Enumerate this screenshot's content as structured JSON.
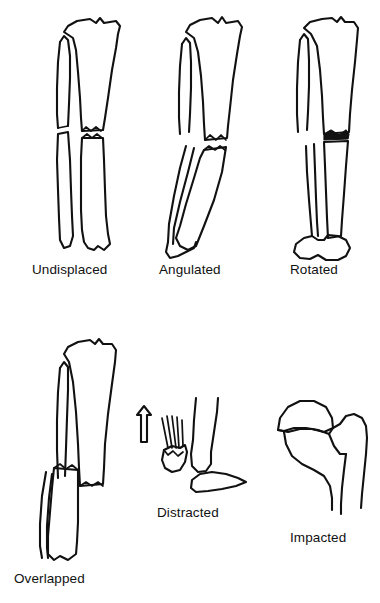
{
  "illustration": {
    "title": "Types of fracture displacement",
    "background_color": "#ffffff",
    "ink_color": "#111111",
    "style": "black-and-white hand-drawn line illustration"
  },
  "figures": [
    {
      "id": "undisplaced",
      "label": "Undisplaced",
      "bone": "tibia and fibula",
      "view": "anteroposterior",
      "description": "Transverse fracture through the tibial shaft with the fragments in anatomical alignment",
      "label_x": 32,
      "label_y": 262
    },
    {
      "id": "angulated",
      "label": "Angulated",
      "bone": "tibia and fibula",
      "view": "anteroposterior",
      "description": "Distal fragment tilted at an angle to the proximal fragment",
      "label_x": 159,
      "label_y": 262
    },
    {
      "id": "rotated",
      "label": "Rotated",
      "bone": "tibia and fibula",
      "view": "anteroposterior",
      "description": "Distal fragment twisted about the long axis so the ankle faces a different direction",
      "label_x": 290,
      "label_y": 262
    },
    {
      "id": "overlapped",
      "label": "Overlapped",
      "bone": "tibia and fibula",
      "view": "anteroposterior",
      "description": "Fragments displaced side by side and overriding, producing shortening",
      "label_x": 14,
      "label_y": 571
    },
    {
      "id": "distracted",
      "label": "Distracted",
      "bone": "patella at the knee joint",
      "view": "lateral",
      "description": "Avulsed fragment pulled away from the main bone by tendon traction, shown with a direction arrow",
      "label_x": 157,
      "label_y": 505
    },
    {
      "id": "impacted",
      "label": "Impacted",
      "bone": "proximal femur",
      "view": "anteroposterior",
      "description": "Femoral head driven into the femoral neck so the fragments are telescoped together",
      "label_x": 290,
      "label_y": 530
    }
  ],
  "annotations": {
    "traction_arrow": "up-arrow-icon",
    "tendon_fibers": "tendon-fiber-lines"
  }
}
